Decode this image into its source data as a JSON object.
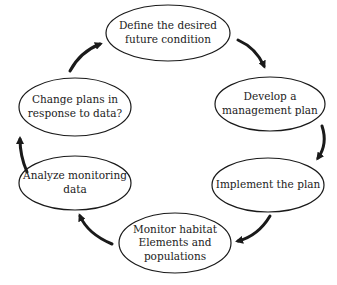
{
  "diagram": {
    "type": "cycle",
    "nodes": [
      {
        "id": "define",
        "label": "Define the desired\nfuture condition"
      },
      {
        "id": "develop",
        "label": "Develop a\nmanagement plan"
      },
      {
        "id": "implement",
        "label": "Implement the plan"
      },
      {
        "id": "monitor",
        "label": "Monitor habitat\nElements and\npopulations"
      },
      {
        "id": "analyze",
        "label": "Analyze monitoring\ndata"
      },
      {
        "id": "change",
        "label": "Change plans in\nresponse to data?"
      }
    ],
    "edges": [
      {
        "from": "define",
        "to": "develop"
      },
      {
        "from": "develop",
        "to": "implement"
      },
      {
        "from": "implement",
        "to": "monitor"
      },
      {
        "from": "monitor",
        "to": "analyze"
      },
      {
        "from": "analyze",
        "to": "change"
      },
      {
        "from": "change",
        "to": "define"
      }
    ],
    "colors": {
      "stroke": "#1a1a1a",
      "text": "#222222",
      "background": "#ffffff"
    }
  }
}
